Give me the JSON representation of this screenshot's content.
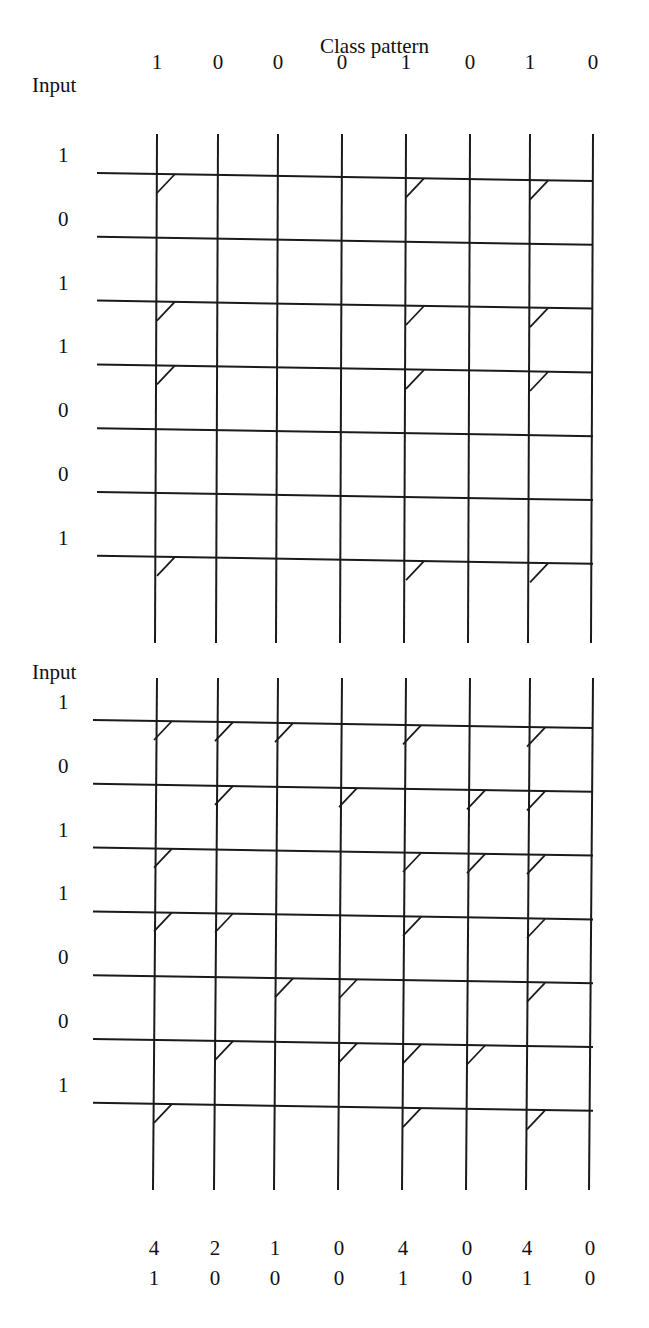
{
  "title": "Class pattern",
  "input_label": "Input",
  "class_pattern": [
    "1",
    "0",
    "0",
    "0",
    "1",
    "0",
    "1",
    "0"
  ],
  "top_matrix": {
    "input_values": [
      "1",
      "0",
      "1",
      "1",
      "0",
      "0",
      "1"
    ],
    "connections": [
      [
        1,
        0,
        0,
        0,
        1,
        0,
        1,
        0
      ],
      [
        0,
        0,
        0,
        0,
        0,
        0,
        0,
        0
      ],
      [
        1,
        0,
        0,
        0,
        1,
        0,
        1,
        0
      ],
      [
        1,
        0,
        0,
        0,
        1,
        0,
        1,
        0
      ],
      [
        0,
        0,
        0,
        0,
        0,
        0,
        0,
        0
      ],
      [
        0,
        0,
        0,
        0,
        0,
        0,
        0,
        0
      ],
      [
        1,
        0,
        0,
        0,
        1,
        0,
        1,
        0
      ]
    ]
  },
  "bottom_matrix": {
    "input_values": [
      "1",
      "0",
      "1",
      "1",
      "0",
      "0",
      "1"
    ],
    "connections": [
      [
        1,
        1,
        1,
        0,
        1,
        0,
        1,
        0
      ],
      [
        0,
        1,
        0,
        1,
        0,
        1,
        1,
        0
      ],
      [
        1,
        0,
        0,
        0,
        1,
        1,
        1,
        0
      ],
      [
        1,
        1,
        0,
        0,
        1,
        0,
        1,
        0
      ],
      [
        0,
        0,
        1,
        1,
        0,
        0,
        1,
        0
      ],
      [
        0,
        1,
        0,
        1,
        1,
        1,
        0,
        0
      ],
      [
        1,
        0,
        0,
        0,
        1,
        0,
        1,
        0
      ]
    ],
    "column_sums": [
      "4",
      "2",
      "1",
      "0",
      "4",
      "0",
      "4",
      "0"
    ],
    "thresholded_output": [
      "1",
      "0",
      "0",
      "0",
      "1",
      "0",
      "1",
      "0"
    ]
  },
  "colors": {
    "line": "#1a1a1a",
    "background": "#ffffff"
  }
}
